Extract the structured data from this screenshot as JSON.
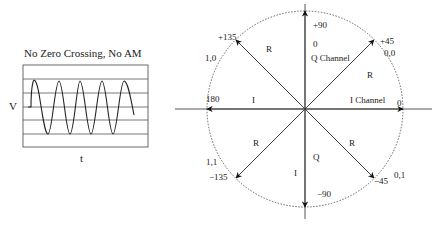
{
  "waveform": {
    "title": "No Zero Crossing, No AM",
    "y_label": "V",
    "x_label": "t",
    "gridlines": 7,
    "cycles": 3.6
  },
  "constellation": {
    "axis_labels": {
      "i_channel": "I Channel",
      "q_channel": "Q Channel"
    },
    "angle_labels": {
      "a0": "0",
      "a45": "+45",
      "a90": "+90",
      "a135": "+135",
      "a180": "180",
      "am135": "−135",
      "am90": "−90",
      "am45": "−45"
    },
    "symbols": {
      "s45": "0,0",
      "s135": "1,0",
      "sm135": "1,1",
      "sm45": "0,1"
    },
    "vector_labels": {
      "r_q1": "R",
      "r_q2": "R",
      "r_q3": "R",
      "r_q4": "R",
      "i_left": "I",
      "i_down": "I",
      "q_down": "Q",
      "q_zero": "0"
    },
    "colors": {
      "line": "#333333",
      "circle": "#555555"
    }
  }
}
